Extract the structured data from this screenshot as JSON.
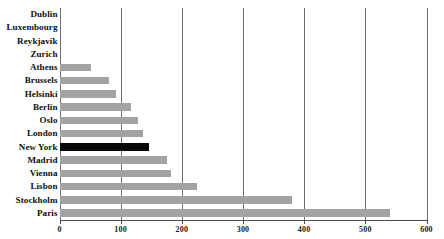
{
  "chart_data": {
    "type": "bar",
    "orientation": "horizontal",
    "title": "",
    "subtitle": "",
    "xlabel": "",
    "ylabel": "",
    "xlim": [
      0,
      600
    ],
    "ylim": null,
    "grid": "vertical",
    "legend": null,
    "xticks": [
      0,
      100,
      200,
      300,
      400,
      500,
      600
    ],
    "xtick_labels": [
      "0",
      "100",
      "200",
      "300",
      "400",
      "500",
      "600"
    ],
    "categories": [
      "Dublin",
      "Luxembourg",
      "Reykjavik",
      "Zurich",
      "Athens",
      "Brussels",
      "Helsinki",
      "Berlin",
      "Oslo",
      "London",
      "New York",
      "Madrid",
      "Vienna",
      "Lisbon",
      "Stockholm",
      "Paris"
    ],
    "values": [
      0,
      0,
      0,
      0,
      51,
      81,
      93,
      117,
      128,
      137,
      147,
      175,
      182,
      224,
      380,
      540
    ],
    "highlight_category": "New York",
    "colors": {
      "bar": "#a3a3a3",
      "highlight_bar": "#070707",
      "gridline": "#6f6f6f",
      "axis": "#4a4a4a",
      "text": "#0d0d0d",
      "background": "#ffffff"
    }
  }
}
